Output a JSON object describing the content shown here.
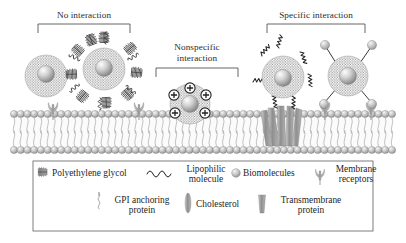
{
  "figure": {
    "background_color": "#ffffff",
    "line_color": "#4a4a4a",
    "text_color": "#222222"
  },
  "brackets": [
    {
      "id": "no-interaction",
      "label": "No interaction",
      "x": 36,
      "y": 12,
      "width": 100,
      "bracket_y": 24,
      "bracket_x1": 38,
      "bracket_x2": 130,
      "drop": 9
    },
    {
      "id": "nonspecific-interaction",
      "label_line1": "Nonspecific",
      "label_line2": "interaction",
      "x": 155,
      "y": 44,
      "width": 86,
      "bracket_y": 68,
      "bracket_x1": 156,
      "bracket_x2": 238,
      "drop": 9
    },
    {
      "id": "specific-interaction",
      "label": "Specific interaction",
      "x": 262,
      "y": 12,
      "width": 114,
      "bracket_y": 24,
      "bracket_x1": 267,
      "bracket_x2": 365,
      "drop": 9
    }
  ],
  "membrane": {
    "top_head_row_y": 114,
    "bottom_head_row_y": 150,
    "head_radius": 3.6,
    "head_count": 57,
    "head_fill": "#b9b9b9",
    "head_stroke": "#6f6f6f",
    "tail_color": "#9a9a9a",
    "left_x": 14,
    "right_x": 392
  },
  "particles": [
    {
      "id": "bare-nanoparticle",
      "label": "Bare nanoparticle with corona",
      "cx": 46,
      "cy": 76,
      "corona_r": 21,
      "core_r": 8.5,
      "has_peg": false,
      "has_charges": false,
      "has_biomolecules": false,
      "has_lipophilic": false
    },
    {
      "id": "peg-coated-nanoparticle",
      "label": "PEG-coated nanoparticle",
      "cx": 104,
      "cy": 69,
      "corona_r": 21,
      "core_r": 8.5,
      "has_peg": true,
      "peg_count": 9,
      "has_charges": false,
      "has_biomolecules": false,
      "has_lipophilic": false
    },
    {
      "id": "cationic-nanoparticle",
      "label": "Positively charged nanoparticle",
      "cx": 190,
      "cy": 104,
      "corona_r": 20,
      "core_r": 8.5,
      "has_peg": false,
      "has_charges": true,
      "charge_count": 5,
      "charge_symbol": "+",
      "has_biomolecules": false,
      "has_lipophilic": false
    },
    {
      "id": "lipophilic-nanoparticle",
      "label": "Nanoparticle with lipophilic molecules",
      "cx": 283,
      "cy": 77,
      "corona_r": 21,
      "core_r": 8.5,
      "has_peg": false,
      "has_charges": false,
      "has_biomolecules": false,
      "has_lipophilic": true,
      "lipophilic_count": 5
    },
    {
      "id": "targeted-nanoparticle",
      "label": "Nanoparticle with targeting biomolecules",
      "cx": 348,
      "cy": 76,
      "corona_r": 20,
      "core_r": 8.5,
      "has_peg": false,
      "has_charges": false,
      "has_biomolecules": true,
      "biomolecule_count": 4,
      "has_lipophilic": false
    }
  ],
  "membrane_features": [
    {
      "id": "receptor-left-1",
      "type": "membrane-receptor",
      "x": 53,
      "y": 114
    },
    {
      "id": "receptor-left-2",
      "type": "membrane-receptor",
      "x": 139,
      "y": 114
    },
    {
      "id": "receptor-right-1",
      "type": "membrane-receptor",
      "x": 325,
      "y": 114
    },
    {
      "id": "receptor-right-2",
      "type": "membrane-receptor",
      "x": 371,
      "y": 114
    },
    {
      "id": "transmembrane-cluster",
      "type": "transmembrane-protein-cluster",
      "x": 283,
      "y": 114,
      "count": 5
    }
  ],
  "legend": {
    "box": {
      "x": 33,
      "y": 161,
      "width": 340,
      "height": 70,
      "stroke": "#6f6f6f"
    },
    "row1": [
      {
        "id": "polyethylene-glycol",
        "icon": "peg-brush-icon",
        "label": "Polyethylene glycol",
        "icon_x": 40,
        "icon_y": 172,
        "text_x": 55,
        "text_y": 167,
        "align": "left"
      },
      {
        "id": "lipophilic-molecule",
        "icon": "zigzag-wave-icon",
        "label_line1": "Lipophilic",
        "label_line2": "molecule",
        "icon_x": 153,
        "icon_y": 172,
        "text_x": 181,
        "text_y": 163
      },
      {
        "id": "biomolecules",
        "icon": "sphere-icon",
        "label": "Biomolecules",
        "icon_x": 234,
        "icon_y": 172,
        "text_x": 243,
        "text_y": 167,
        "align": "left"
      },
      {
        "id": "membrane-receptors",
        "icon": "receptor-icon",
        "label_line1": "Membrane",
        "label_line2": "receptors",
        "icon_x": 318,
        "icon_y": 172,
        "text_x": 328,
        "text_y": 163
      }
    ],
    "row2": [
      {
        "id": "gpi-anchoring-protein",
        "icon": "gpi-squiggle-icon",
        "label_line1": "GPI anchoring",
        "label_line2": "protein",
        "icon_x": 99,
        "icon_y": 203,
        "text_x": 110,
        "text_y": 194
      },
      {
        "id": "cholesterol",
        "icon": "cholesterol-ellipse-icon",
        "label": "Cholesterol",
        "icon_x": 188,
        "icon_y": 203,
        "text_x": 197,
        "text_y": 199,
        "align": "left"
      },
      {
        "id": "transmembrane-protein",
        "icon": "transmembrane-icon",
        "label_line1": "Transmembrane",
        "label_line2": "protein",
        "icon_x": 262,
        "icon_y": 203,
        "text_x": 273,
        "text_y": 194
      }
    ]
  },
  "colors": {
    "corona_dot": "#8d8d8d",
    "core_light": "#f2f2f2",
    "core_dark": "#8a8a8a",
    "peg_dark": "#3a3a3a",
    "receptor_gray": "#a8a8a8",
    "transmembrane_gray": "#9c9c9c",
    "charge_dark": "#2e2e2e",
    "lipophilic_dark": "#2a2a2a"
  }
}
